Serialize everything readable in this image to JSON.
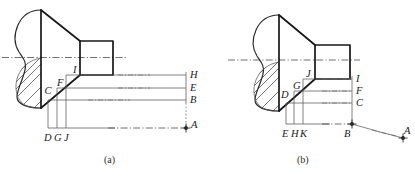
{
  "figure": {
    "captions": [
      {
        "id": "caption-a",
        "text": "(a)"
      },
      {
        "id": "caption-b",
        "text": "(b)"
      }
    ],
    "colors": {
      "outline_heavy": "#171717",
      "outline_medium": "#262626",
      "projection_thin": "#5a5a5a",
      "centerline": "#4d4d4d",
      "hatch": "#3a3a3a",
      "label_text": "#1a1a1a",
      "background": "#ffffff"
    },
    "panels": [
      {
        "id": "panel-a",
        "caption": "(a)",
        "diagonal_labels": [
          "C",
          "F",
          "I"
        ],
        "bottom_labels": [
          "D",
          "G",
          "J"
        ],
        "right_labels": [
          "H",
          "E",
          "B"
        ],
        "point_label": "A"
      },
      {
        "id": "panel-b",
        "caption": "(b)",
        "diagonal_labels": [
          "D",
          "G",
          "J"
        ],
        "bottom_labels": [
          "E",
          "H",
          "K"
        ],
        "right_labels": [
          "I",
          "F",
          "C"
        ],
        "base_point_label": "B",
        "point_label": "A"
      }
    ]
  }
}
